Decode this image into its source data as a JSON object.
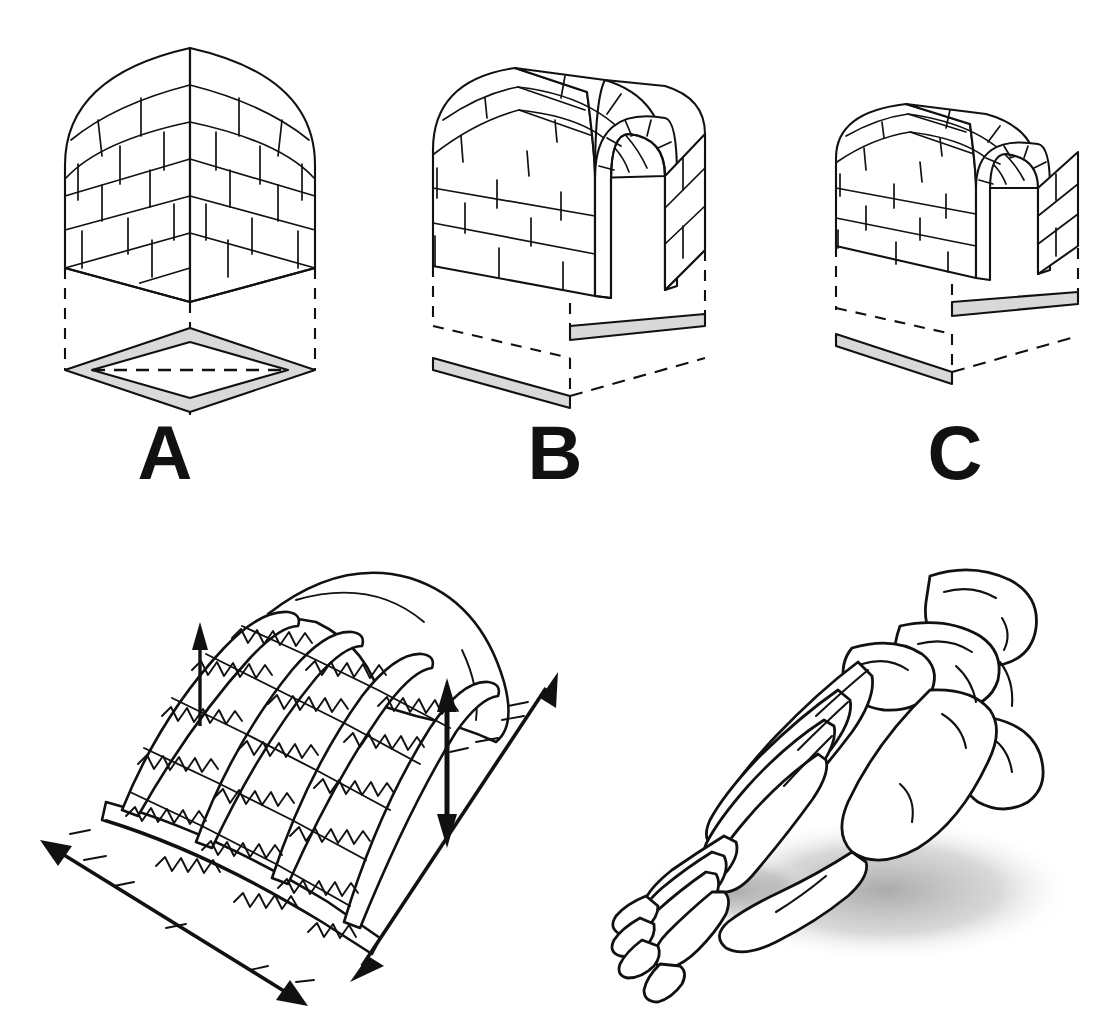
{
  "figure": {
    "type": "scientific-illustration",
    "background_color": "#ffffff",
    "line_color": "#111111",
    "accent_grey": "#d9d9d9",
    "shadow_grey": "#9a9a9a",
    "panels": [
      {
        "id": "A",
        "label": "A",
        "subject": "masonry dome vault",
        "description": "Closed brick dome with two visible faces meeting at a central vertical ridge; base footprint shown below as a grey square ring in isometric view with dashed projection lines.",
        "base_shape": "square-ring",
        "base_support_strips": 4,
        "has_dashed_projection": true,
        "has_dashed_diagonal": true
      },
      {
        "id": "B",
        "label": "B",
        "subject": "barrel vault, tall",
        "description": "Brick barrel vault (tunnel) open at the front; voussoir arch ring at the opening; base footprint shown below with two grey strips along opposite edges.",
        "base_shape": "square-outline",
        "base_support_strips": 2,
        "has_dashed_projection": true,
        "has_dashed_diagonal": false
      },
      {
        "id": "C",
        "label": "C",
        "subject": "barrel vault, short",
        "description": "Shorter brick barrel vault open at the front; voussoir arch ring at the opening; base footprint shown below with two grey strips along opposite edges.",
        "base_shape": "square-outline",
        "base_support_strips": 2,
        "has_dashed_projection": true,
        "has_dashed_diagonal": false
      }
    ],
    "lower_left": {
      "id": "spring-arch-model",
      "subject": "mechanical arch model",
      "description": "Hand-drawn mechanical analogue of an arch: four curved longitudinal rods (ribs) springing from a flat base plate, joined by transverse bars and zigzag coil springs, covered at the rear by a curved dome sheet.",
      "elements": {
        "rod_count": 4,
        "spring_rows": 6,
        "base_plate": "flat rectangular slab",
        "dome_sheet": "curved rear shell"
      },
      "arrows": [
        {
          "name": "rise-arrow",
          "style": "single-headed",
          "orientation": "vertical-up",
          "meaning": "arch rise"
        },
        {
          "name": "height-arrow",
          "style": "double-headed",
          "orientation": "vertical",
          "meaning": "arch height change"
        },
        {
          "name": "longitudinal-arrow",
          "style": "double-headed",
          "orientation": "diagonal-front-left",
          "meaning": "longitudinal length change"
        },
        {
          "name": "transverse-arrow",
          "style": "double-headed",
          "orientation": "diagonal-right",
          "meaning": "transverse width change"
        }
      ]
    },
    "lower_right": {
      "id": "foot-skeleton",
      "subject": "human foot skeleton",
      "description": "Line drawing of a right human foot skeleton seen from an anterolateral angle, showing phalanges, metatarsals, tarsals, talus and calcaneus, resting on a soft grey cast shadow.",
      "has_cast_shadow": true
    }
  }
}
